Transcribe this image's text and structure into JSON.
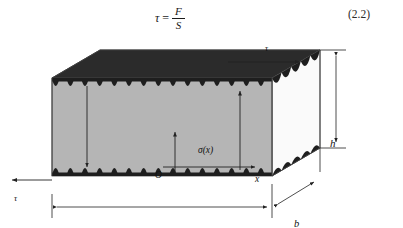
{
  "equation": {
    "tau_symbol": "τ",
    "equals": "=",
    "numerator": "F",
    "denominator": "S",
    "number": "(2.2)"
  },
  "figure": {
    "type": "engineering-diagram",
    "labels": {
      "tau_top": "τ",
      "tau_left": "τ",
      "height": "h",
      "breadth": "b",
      "length": "l",
      "origin": "O",
      "x_axis": "x",
      "stress_function": "σ(x)"
    },
    "colors": {
      "top_face": "#2b2b2b",
      "front_face": "#b5b5b5",
      "side_face": "#f4f4f4",
      "serration": "#1e1e1e",
      "outline": "#3a3a3a",
      "arrow": "#222222"
    },
    "geometry": {
      "front_left_x": 52,
      "front_right_x": 272,
      "front_top_y": 44,
      "front_bottom_y": 142,
      "depth_dx": 48,
      "depth_dy": -28,
      "serration_count_front": 15,
      "serration_count_side": 5
    },
    "dimension_lines": {
      "length_span": "52 to 272",
      "height_span": "16 to 142",
      "breadth_direction": "diagonal lower-left to upper-right"
    }
  }
}
